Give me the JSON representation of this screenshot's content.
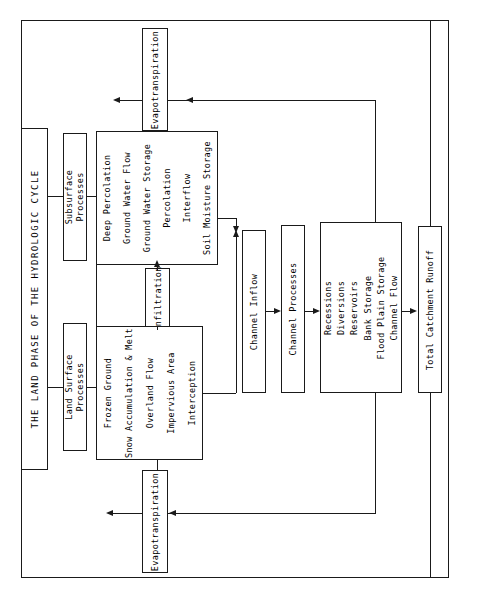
{
  "diagram": {
    "title": "THE LAND PHASE OF THE HYDROLOGIC CYCLE",
    "orientation": "rotated-90-ccw",
    "boxes": {
      "evapotranspiration_top": "Evapotranspiration",
      "evapotranspiration_bottom": "Evapotranspiration",
      "subsurface_processes": "Subsurface\nProcesses",
      "subsurface_processes_line1": "Subsurface",
      "subsurface_processes_line2": "Processes",
      "land_surface_processes_line1": "Land Surface",
      "land_surface_processes_line2": "Processes",
      "infiltration": "Infiltration",
      "channel_inflow": "Channel Inflow",
      "channel_processes": "Channel Processes",
      "total_catchment_runoff": "Total Catchment Runoff"
    },
    "subsurface_items": [
      "Soil Moisture Storage",
      "Interflow",
      "Percolation",
      "Ground Water Storage",
      "Ground Water Flow",
      "Deep Percolation"
    ],
    "land_surface_items": [
      "Interception",
      "Impervious Area",
      "Overland Flow",
      "Snow Accumulation & Melt",
      "Frozen Ground"
    ],
    "channel_items": [
      "Channel Flow",
      "Flood Plain Storage",
      "Bank Storage",
      "Reservoirs",
      "Diversions",
      "Recessions"
    ],
    "colors": {
      "stroke": "#1a1a1a",
      "background": "#ffffff",
      "text": "#000000"
    }
  }
}
